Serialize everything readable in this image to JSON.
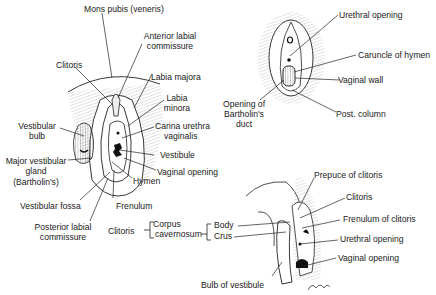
{
  "figures": {
    "external": {
      "labels": {
        "mons_pubis": "Mons pubis (veneris)",
        "anterior_commissure_1": "Anterior labial",
        "anterior_commissure_2": "commissure",
        "clitoris": "Clitoris",
        "labia_majora": "Labia majora",
        "labia_minora_1": "Labia",
        "labia_minora_2": "minora",
        "carina_1": "Carina urethra",
        "carina_2": "vaginalis",
        "vestibular_bulb_1": "Vestibular",
        "vestibular_bulb_2": "bulb",
        "vestibule": "Vestibule",
        "major_gland_1": "Major vestibular",
        "major_gland_2": "gland",
        "major_gland_3": "(Bartholin's)",
        "vaginal_opening": "Vaginal opening",
        "hymen": "Hymen",
        "vestibular_fossa": "Vestibular fossa",
        "frenulum": "Frenulum",
        "posterior_commissure_1": "Posterior labial",
        "posterior_commissure_2": "commissure"
      }
    },
    "vestibule_detail": {
      "labels": {
        "urethral_opening": "Urethral opening",
        "caruncle": "Caruncle of hymen",
        "vaginal_wall": "Vaginal  wall",
        "bartholin_duct_1": "Opening of",
        "bartholin_duct_2": "Bartholin's",
        "bartholin_duct_3": "duct",
        "post_column": "Post.  column"
      }
    },
    "clitoris_detail": {
      "legend": {
        "clitoris": "Clitoris",
        "corpus_1": "Corpus",
        "corpus_2": "cavernosum",
        "body": "Body",
        "crus": "Crus"
      },
      "labels": {
        "prepuce": "Prepuce of clitoris",
        "clitoris": "Clitoris",
        "frenulum": "Frenulum of clitoris",
        "urethral_opening": "Urethral opening",
        "vaginal_opening": "Vaginal opening",
        "bulb": "Bulb of vestibule"
      },
      "signature": "Bradley"
    }
  },
  "colors": {
    "ink": "#1a1a1a",
    "background": "#ffffff"
  }
}
